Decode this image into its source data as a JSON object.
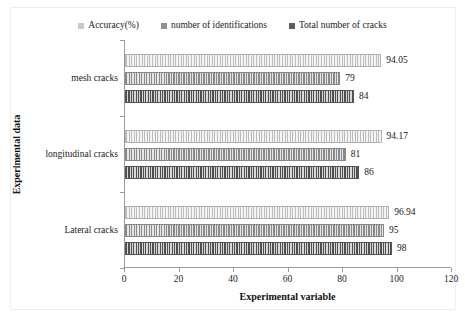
{
  "chart_data": {
    "type": "bar",
    "orientation": "horizontal",
    "title": "",
    "xlabel": "Experimental variable",
    "ylabel": "Experimental data",
    "xlim": [
      0,
      120
    ],
    "xticks": [
      0,
      20,
      40,
      60,
      80,
      100,
      120
    ],
    "grid": false,
    "legend_position": "top-center",
    "categories": [
      "Lateral cracks",
      "longitudinal cracks",
      "mesh cracks"
    ],
    "series": [
      {
        "name": "Accuracy(%)",
        "color": "#c9c9c9",
        "values": [
          96.94,
          94.17,
          94.05
        ],
        "labels": [
          "96.94",
          "94.17",
          "94.05"
        ]
      },
      {
        "name": "number of identifications",
        "color": "#8f8f8f",
        "values": [
          95,
          81,
          79
        ],
        "labels": [
          "95",
          "81",
          "79"
        ]
      },
      {
        "name": "Total number of cracks",
        "color": "#5c5c5c",
        "values": [
          98,
          86,
          84
        ],
        "labels": [
          "98",
          "86",
          "84"
        ]
      }
    ]
  },
  "legend": {
    "items": [
      {
        "label": "Accuracy(%)"
      },
      {
        "label": "number of identifications"
      },
      {
        "label": "Total number of cracks"
      }
    ]
  },
  "axes": {
    "x_title": "Experimental variable",
    "y_title": "Experimental data",
    "x_tick_labels": [
      "0",
      "20",
      "40",
      "60",
      "80",
      "100",
      "120"
    ],
    "y_category_labels": [
      "mesh cracks",
      "longitudinal cracks",
      "Lateral cracks"
    ]
  }
}
